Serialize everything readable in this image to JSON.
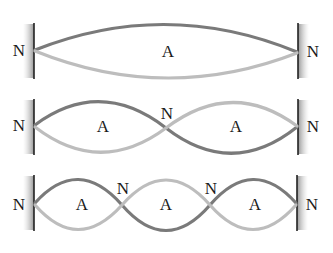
{
  "diagram": {
    "label_node": "N",
    "label_antinode": "A",
    "colors": {
      "wave_dark": "#7a7a7a",
      "wave_light": "#bdbdbd",
      "wall_shade": "#9a9a9a",
      "wall_line": "#222222",
      "text": "#1a1a1a"
    },
    "modes": [
      {
        "harmonic": 1,
        "loops": 1,
        "nodes": [
          "N",
          "N"
        ],
        "antinodes": [
          "A"
        ]
      },
      {
        "harmonic": 2,
        "loops": 2,
        "nodes": [
          "N",
          "N",
          "N"
        ],
        "antinodes": [
          "A",
          "A"
        ]
      },
      {
        "harmonic": 3,
        "loops": 3,
        "nodes": [
          "N",
          "N",
          "N",
          "N"
        ],
        "antinodes": [
          "A",
          "A",
          "A"
        ]
      }
    ]
  }
}
